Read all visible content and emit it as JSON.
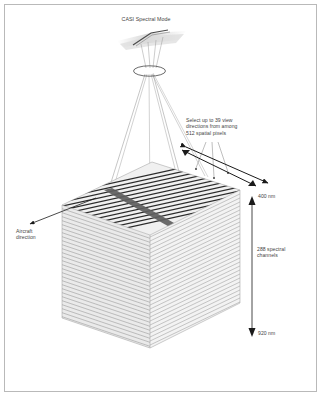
{
  "figure": {
    "title": "CASI Spectral Mode",
    "domain": "diagram",
    "background_color": "#ffffff",
    "border_color": "#b9b9b9",
    "text_color": "#444444"
  },
  "labels": {
    "title": "CASI Spectral Mode",
    "view_directions": "Select up to 39 view\ndirections from among\n512 spatial pixels",
    "aircraft_direction": "Aircraft\ndirection",
    "wavelength_top": "400 nm",
    "wavelength_bottom": "920 nm",
    "spectral_channels": "288 spectral\nchannels"
  },
  "values": {
    "view_directions_count": 39,
    "spatial_pixels": 512,
    "spectral_channels": 288,
    "wavelength_min_nm": 400,
    "wavelength_max_nm": 920
  },
  "icons": {
    "aircraft": "aircraft-icon",
    "lens": "lens-aperture-icon",
    "stack": "spectral-cube-icon"
  },
  "colors": {
    "stripe_dark": "#2b2b2b",
    "stripe_light": "#c9c9c9",
    "face_fill": "#efefef",
    "side_fill": "#e2e2e2",
    "aircraft_fill": "#d8d8d8",
    "ray_color": "#8a8a8a",
    "arrow_color": "#1a1a1a"
  }
}
